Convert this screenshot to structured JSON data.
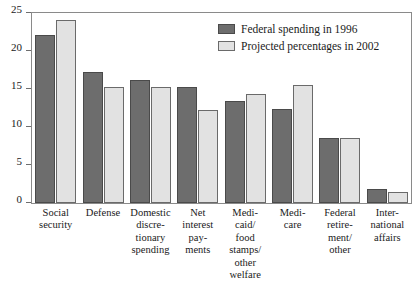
{
  "chart_data": {
    "type": "bar",
    "title": "",
    "subtitle": "",
    "xlabel": "",
    "ylabel": "",
    "ylim": [
      0,
      25
    ],
    "yticks": [
      0,
      5,
      10,
      15,
      20,
      25
    ],
    "ytick_labels": [
      "0",
      "5",
      "10",
      "15",
      "20",
      "25"
    ],
    "grid": false,
    "legend_position": "top-right",
    "categories": [
      "Social\nsecurity",
      "Defense",
      "Domestic\ndiscre-\ntionary\nspending",
      "Net\ninterest\npay-\nments",
      "Medi-\ncaid/\nfood\nstamps/\nother\nwelfare",
      "Medi-\ncare",
      "Federal\nretire-\nment/\nother",
      "Inter-\nnational\naffairs"
    ],
    "series": [
      {
        "name": "Federal spending in 1996",
        "color": "#6d6d6d",
        "values": [
          22.1,
          17.2,
          16.2,
          15.3,
          13.4,
          12.4,
          8.5,
          1.8
        ]
      },
      {
        "name": "Projected percentages in 2002",
        "color": "#e2e2e2",
        "values": [
          24.1,
          15.2,
          15.3,
          12.3,
          14.4,
          15.5,
          8.5,
          1.5
        ]
      }
    ]
  },
  "legend": {
    "items": [
      {
        "label": "Federal spending in 1996"
      },
      {
        "label": "Projected percentages in 2002"
      }
    ]
  }
}
